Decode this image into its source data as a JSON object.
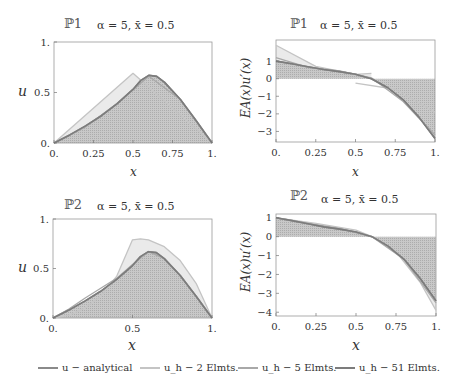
{
  "colors": {
    "analytical": "#8a8a8a",
    "h2": "#c4c4c4",
    "h5": "#a8a8a8",
    "h51": "#7c7c7c",
    "fill_dark": "#b5b5b5",
    "fill_light": "#e8e8e8",
    "frame": "#9a9a9a"
  },
  "legend": [
    {
      "label": "u − analytical",
      "color": "#8a8a8a"
    },
    {
      "label": "u_h − 2 Elmts.",
      "color": "#c4c4c4"
    },
    {
      "label": "u_h − 5 Elmts.",
      "color": "#a8a8a8"
    },
    {
      "label": "u_h − 51 Elmts.",
      "color": "#7c7c7c"
    }
  ],
  "chart_data": [
    {
      "id": "P1-displacement",
      "type": "line",
      "problem": "ℙ1",
      "title": "α = 5,  x̄ = 0.5",
      "xlabel": "x",
      "ylabel": "u",
      "xlim": [
        0,
        1
      ],
      "ylim": [
        0,
        1
      ],
      "xticks": [
        "0.",
        "0.25",
        "0.5",
        "0.75",
        "1."
      ],
      "yticks": [
        "0.",
        "0.5",
        "1."
      ],
      "series": [
        {
          "name": "u − analytical",
          "x": [
            0,
            0.1,
            0.2,
            0.3,
            0.4,
            0.5,
            0.55,
            0.6,
            0.65,
            0.7,
            0.8,
            0.9,
            1.0
          ],
          "y": [
            0,
            0.08,
            0.17,
            0.27,
            0.39,
            0.53,
            0.62,
            0.67,
            0.66,
            0.6,
            0.43,
            0.22,
            0
          ]
        },
        {
          "name": "u_h − 2 Elmts.",
          "x": [
            0,
            0.5,
            1.0
          ],
          "y": [
            0,
            0.69,
            0
          ]
        },
        {
          "name": "u_h − 5 Elmts.",
          "x": [
            0,
            0.2,
            0.4,
            0.6,
            0.8,
            1.0
          ],
          "y": [
            0,
            0.16,
            0.39,
            0.66,
            0.43,
            0
          ]
        },
        {
          "name": "u_h − 51 Elmts.",
          "x": [
            0,
            0.1,
            0.2,
            0.3,
            0.4,
            0.5,
            0.55,
            0.6,
            0.65,
            0.7,
            0.8,
            0.9,
            1.0
          ],
          "y": [
            0,
            0.08,
            0.17,
            0.27,
            0.39,
            0.53,
            0.62,
            0.67,
            0.66,
            0.6,
            0.43,
            0.22,
            0
          ]
        }
      ]
    },
    {
      "id": "P1-flux",
      "type": "line",
      "problem": "ℙ1",
      "title": "α = 5,  x̄ = 0.5",
      "xlabel": "x",
      "ylabel": "EA(x)u′(x)",
      "xlim": [
        0,
        1
      ],
      "ylim": [
        -3.6,
        2.2
      ],
      "xticks": [
        "0.",
        "0.25",
        "0.5",
        "0.75",
        "1."
      ],
      "yticks": [
        "1",
        "0",
        "−1",
        "−2",
        "−3"
      ],
      "series": [
        {
          "name": "u − analytical",
          "x": [
            0,
            0.1,
            0.2,
            0.3,
            0.4,
            0.5,
            0.6,
            0.7,
            0.8,
            0.9,
            1.0
          ],
          "y": [
            1.0,
            0.85,
            0.68,
            0.52,
            0.4,
            0.25,
            0.0,
            -0.5,
            -1.2,
            -2.2,
            -3.4
          ]
        },
        {
          "name": "u_h − 2 Elmts.",
          "x": [
            0,
            0.25,
            0.5,
            0.6
          ],
          "y": [
            1.9,
            0.7,
            0.25,
            0.3
          ]
        },
        {
          "name": "u_h − 2 Elmts. (elem 2)",
          "x": [
            0.5,
            0.75,
            1.0
          ],
          "y": [
            -0.25,
            -0.6,
            -1.9
          ]
        },
        {
          "name": "u_h − 5 Elmts.",
          "x": [
            0,
            0.2,
            0.4,
            0.6,
            0.8,
            1.0
          ],
          "y": [
            1.2,
            0.65,
            0.45,
            0.05,
            -1.3,
            -3.2
          ]
        },
        {
          "name": "u_h − 51 Elmts.",
          "x": [
            0,
            0.1,
            0.2,
            0.3,
            0.4,
            0.5,
            0.6,
            0.7,
            0.8,
            0.9,
            1.0
          ],
          "y": [
            1.0,
            0.85,
            0.68,
            0.52,
            0.4,
            0.25,
            0.0,
            -0.5,
            -1.2,
            -2.2,
            -3.4
          ]
        }
      ]
    },
    {
      "id": "P2-displacement",
      "type": "line",
      "problem": "ℙ2",
      "title": "α = 5,  x̄ = 0.5",
      "xlabel": "x",
      "ylabel": "u",
      "xlim": [
        0,
        1
      ],
      "ylim": [
        0,
        1
      ],
      "xticks": [
        "0.",
        "0.5",
        "1."
      ],
      "yticks": [
        "0.",
        "0.5",
        "1."
      ],
      "series": [
        {
          "name": "u − analytical",
          "x": [
            0,
            0.1,
            0.2,
            0.3,
            0.4,
            0.5,
            0.55,
            0.6,
            0.65,
            0.7,
            0.8,
            0.9,
            1.0
          ],
          "y": [
            0,
            0.08,
            0.17,
            0.27,
            0.39,
            0.53,
            0.62,
            0.67,
            0.66,
            0.6,
            0.43,
            0.22,
            0
          ]
        },
        {
          "name": "u_h − 2 Elmts.",
          "x": [
            0,
            0.1,
            0.2,
            0.3,
            0.4,
            0.5,
            0.55,
            0.6,
            0.7,
            0.8,
            0.9,
            1.0
          ],
          "y": [
            0,
            0.03,
            0.1,
            0.22,
            0.42,
            0.79,
            0.8,
            0.79,
            0.72,
            0.58,
            0.35,
            0
          ]
        },
        {
          "name": "u_h − 5 Elmts.",
          "x": [
            0,
            0.1,
            0.2,
            0.3,
            0.4,
            0.5,
            0.6,
            0.7,
            0.8,
            0.9,
            1.0
          ],
          "y": [
            0,
            0.09,
            0.2,
            0.3,
            0.4,
            0.54,
            0.67,
            0.6,
            0.43,
            0.22,
            0
          ]
        },
        {
          "name": "u_h − 51 Elmts.",
          "x": [
            0,
            0.1,
            0.2,
            0.3,
            0.4,
            0.5,
            0.55,
            0.6,
            0.65,
            0.7,
            0.8,
            0.9,
            1.0
          ],
          "y": [
            0,
            0.08,
            0.17,
            0.27,
            0.39,
            0.53,
            0.62,
            0.67,
            0.66,
            0.6,
            0.43,
            0.22,
            0
          ]
        }
      ]
    },
    {
      "id": "P2-flux",
      "type": "line",
      "problem": "ℙ2",
      "title": "α = 5,  x̄ = 0.5",
      "xlabel": "x",
      "ylabel": "EA(x)u′(x)",
      "xlim": [
        0,
        1
      ],
      "ylim": [
        -4.2,
        1.2
      ],
      "xticks": [
        "0.",
        "0.25",
        "0.5",
        "0.75",
        "1."
      ],
      "yticks": [
        "1",
        "0",
        "−1",
        "−2",
        "−3",
        "−4"
      ],
      "series": [
        {
          "name": "u − analytical",
          "x": [
            0,
            0.1,
            0.2,
            0.3,
            0.4,
            0.5,
            0.6,
            0.7,
            0.8,
            0.9,
            1.0
          ],
          "y": [
            1.0,
            0.85,
            0.68,
            0.52,
            0.4,
            0.25,
            0.0,
            -0.5,
            -1.2,
            -2.2,
            -3.4
          ]
        },
        {
          "name": "u_h − 2 Elmts.",
          "x": [
            0,
            0.25,
            0.5,
            0.6,
            0.75,
            0.9,
            1.0
          ],
          "y": [
            1.0,
            0.7,
            0.35,
            0.0,
            -0.8,
            -2.4,
            -3.9
          ]
        },
        {
          "name": "u_h − 5 Elmts.",
          "x": [
            0,
            0.2,
            0.4,
            0.6,
            0.8,
            1.0
          ],
          "y": [
            1.0,
            0.7,
            0.42,
            0.0,
            -1.2,
            -3.5
          ]
        },
        {
          "name": "u_h − 51 Elmts.",
          "x": [
            0,
            0.1,
            0.2,
            0.3,
            0.4,
            0.5,
            0.6,
            0.7,
            0.8,
            0.9,
            1.0
          ],
          "y": [
            1.0,
            0.85,
            0.68,
            0.52,
            0.4,
            0.25,
            0.0,
            -0.5,
            -1.2,
            -2.2,
            -3.4
          ]
        }
      ]
    }
  ]
}
